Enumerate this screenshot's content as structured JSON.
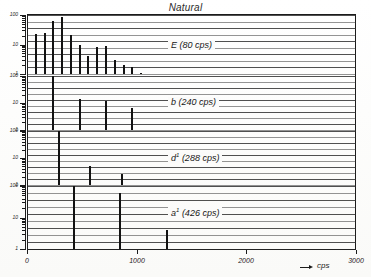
{
  "title": "Natural",
  "axis": {
    "x": {
      "label": "cps",
      "arrow": "→",
      "ticks": [
        {
          "value": 0,
          "label": "0"
        },
        {
          "value": 1000,
          "label": "1000"
        },
        {
          "value": 2000,
          "label": "2000"
        },
        {
          "value": 3000,
          "label": "3000"
        }
      ],
      "min": 0,
      "max": 3000
    },
    "y": {
      "scale": "log",
      "decade_labels": [
        "100",
        "10",
        "1"
      ],
      "note": "each panel repeats a three-decade logarithmic amplitude scale"
    }
  },
  "panels": [
    {
      "id": "E",
      "caption_note": "E",
      "caption_sup": "",
      "caption_freq": "(80 cps)",
      "fundamental_cps": 80,
      "caption": "E (80 cps)"
    },
    {
      "id": "b",
      "caption_note": "b",
      "caption_sup": "",
      "caption_freq": "(240 cps)",
      "fundamental_cps": 240,
      "caption": "b (240 cps)"
    },
    {
      "id": "d1",
      "caption_note": "d",
      "caption_sup": "1",
      "caption_freq": "(288 cps)",
      "fundamental_cps": 288,
      "caption": "d1 (288 cps)"
    },
    {
      "id": "a1",
      "caption_note": "a",
      "caption_sup": "1",
      "caption_freq": "(426 cps)",
      "fundamental_cps": 426,
      "caption": "a1 (426 cps)"
    }
  ],
  "chart_data": {
    "type": "bar",
    "title": "Natural",
    "xlabel": "cps",
    "ylabel": "amplitude (relative, log scale)",
    "xlim": [
      0,
      3000
    ],
    "ylim": [
      1,
      100
    ],
    "yscale": "log",
    "grid": false,
    "legend": "none",
    "subplots": [
      {
        "name": "E (80 cps)",
        "x": [
          80,
          160,
          240,
          320,
          400,
          480,
          560,
          640,
          720,
          800,
          880,
          960,
          1040
        ],
        "values": [
          22,
          24,
          62,
          88,
          21,
          9.5,
          4.2,
          8.0,
          9.2,
          3.0,
          2.0,
          1.7,
          1.1
        ],
        "xlabel": "",
        "ylabel": "",
        "ylim": [
          1,
          100
        ]
      },
      {
        "name": "b (240 cps)",
        "x": [
          240,
          480,
          720,
          960
        ],
        "values": [
          100,
          14,
          12,
          6.5
        ],
        "xlabel": "",
        "ylabel": "",
        "ylim": [
          1,
          100
        ]
      },
      {
        "name": "d1 (288 cps)",
        "x": [
          288,
          576,
          864
        ],
        "values": [
          100,
          5.0,
          2.6
        ],
        "xlabel": "",
        "ylabel": "",
        "ylim": [
          1,
          100
        ]
      },
      {
        "name": "a1 (426 cps)",
        "x": [
          426,
          852,
          1278
        ],
        "values": [
          100,
          62,
          4.0
        ],
        "xlabel": "",
        "ylabel": "",
        "ylim": [
          1,
          100
        ]
      }
    ]
  }
}
